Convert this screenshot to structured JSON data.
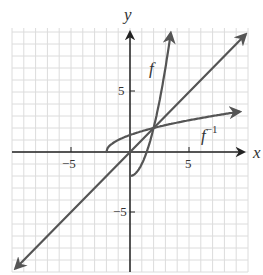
{
  "chart_data": {
    "type": "line",
    "title": "",
    "xlabel": "x",
    "ylabel": "y",
    "xlim": [
      -10,
      10
    ],
    "ylim": [
      -10,
      10
    ],
    "grid": true,
    "grid_step": 1,
    "x_ticks": [
      -5,
      5
    ],
    "y_ticks": [
      5,
      -5
    ],
    "x_tick_labels": [
      "−5",
      "5"
    ],
    "y_tick_labels": [
      "5",
      "−5"
    ],
    "series": [
      {
        "name": "f",
        "label": "f",
        "equation": "y = x^2 - 2, x >= 0",
        "points": [
          [
            0,
            -2
          ],
          [
            0.5,
            -1.75
          ],
          [
            1,
            -1
          ],
          [
            1.5,
            0.25
          ],
          [
            2,
            2
          ],
          [
            2.5,
            4.25
          ],
          [
            3,
            7
          ],
          [
            3.5,
            10.25
          ]
        ]
      },
      {
        "name": "f_inverse",
        "label": "f⁻¹",
        "equation": "y = sqrt(x + 2), x >= -2",
        "points": [
          [
            -2,
            0
          ],
          [
            -1.75,
            0.5
          ],
          [
            -1,
            1
          ],
          [
            0,
            1.41
          ],
          [
            1,
            1.73
          ],
          [
            2,
            2
          ],
          [
            4,
            2.45
          ],
          [
            6,
            2.83
          ],
          [
            8.5,
            3.24
          ]
        ]
      },
      {
        "name": "identity",
        "label": "y = x",
        "equation": "y = x",
        "points": [
          [
            -10,
            -10
          ],
          [
            10,
            10
          ]
        ]
      }
    ],
    "annotations": [
      {
        "text": "f",
        "x": 2.2,
        "y": 7.5
      },
      {
        "text": "f⁻¹",
        "x": 6.2,
        "y": 0.8
      }
    ]
  },
  "labels": {
    "x_axis": "x",
    "y_axis": "y",
    "f": "f",
    "finv_base": "f",
    "finv_sup": "−1",
    "tick_x_neg5": "−5",
    "tick_x_5": "5",
    "tick_y_5": "5",
    "tick_y_neg5": "−5"
  },
  "colors": {
    "curve": "#555555",
    "axis": "#222222",
    "grid": "#d8d8d8"
  }
}
